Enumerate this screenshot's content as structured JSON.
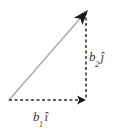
{
  "figure": {
    "type": "vector-decomposition-diagram",
    "background_color": "#ffffff",
    "labels": {
      "vertical_component": {
        "base": "b",
        "subscript": "2",
        "unit_vector": "ĵ"
      },
      "horizontal_component": {
        "base": "b",
        "subscript": "1",
        "unit_vector": "î"
      }
    },
    "colors": {
      "resultant_line": "#aaaaaa",
      "component_line": "#2b2b2b",
      "arrowhead": "#1a1a1a",
      "label_text": "#3a3a3a"
    },
    "geometry": {
      "origin": {
        "x": 9,
        "y": 100
      },
      "tip": {
        "x": 88,
        "y": 10
      },
      "corner": {
        "x": 86,
        "y": 100
      },
      "resultant_stroke_width": 1.4,
      "component_stroke_width": 1.5,
      "dash_pattern": "3 2.5"
    }
  }
}
